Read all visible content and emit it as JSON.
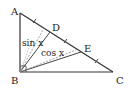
{
  "diagram": {
    "type": "geometry-triangle",
    "points": {
      "A": {
        "label": "A",
        "x": 20,
        "y": 13
      },
      "B": {
        "label": "B",
        "x": 20,
        "y": 72
      },
      "C": {
        "label": "C",
        "x": 113,
        "y": 72
      },
      "D": {
        "label": "D",
        "x": 50,
        "y": 33
      },
      "E": {
        "label": "E",
        "x": 81,
        "y": 52
      }
    },
    "labels": {
      "sin": "sin x",
      "cos": "cos x"
    },
    "colors": {
      "stroke": "#333333",
      "dashed": "#888888",
      "background": "#ffffff"
    }
  }
}
